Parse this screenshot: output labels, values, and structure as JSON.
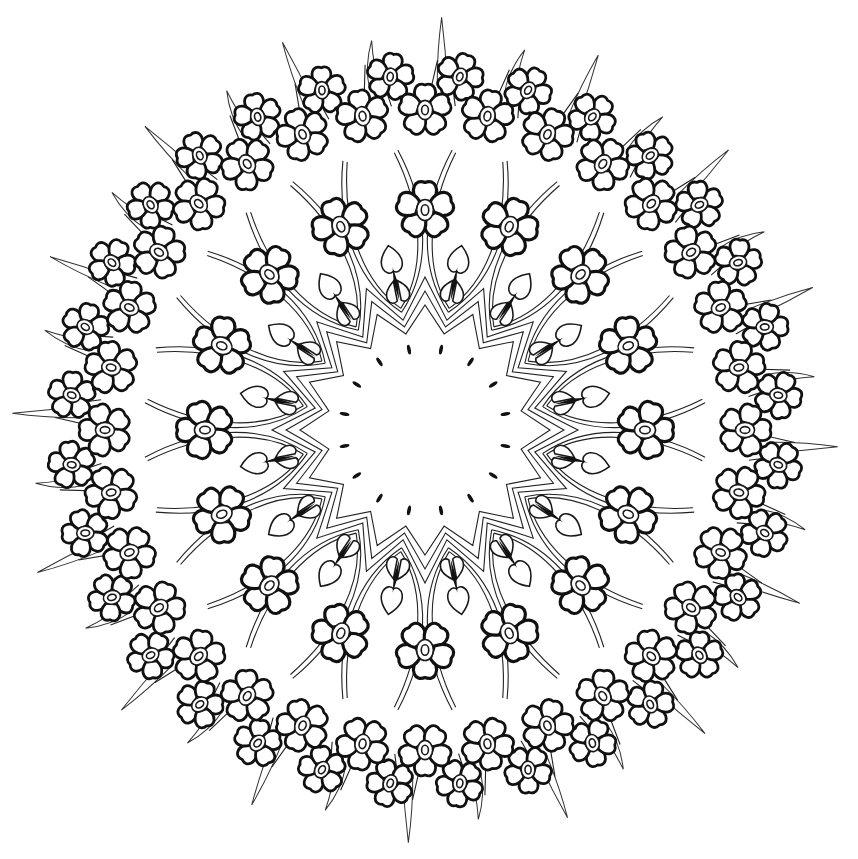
{
  "artwork": {
    "type": "mandala-line-art",
    "background": "#ffffff",
    "ink_color": "#111111",
    "center": [
      425,
      430
    ],
    "layers": {
      "inner_dots": {
        "count": 16,
        "radius": 82
      },
      "star_bands": {
        "points": 16,
        "inner_radius": 98,
        "outer_radius": 125,
        "count": 3
      },
      "petal_fans": {
        "count": 16,
        "radius": 160
      },
      "inner_flowers": {
        "count": 16,
        "radius": 220,
        "size": 22
      },
      "outer_flowers": {
        "count": 32,
        "radius": 320,
        "size": 20
      },
      "rim_flowers": {
        "count": 32,
        "radius": 355,
        "size": 18
      },
      "spikes": {
        "count": 32,
        "inner_radius": 345,
        "outer_radius": 405
      }
    }
  }
}
